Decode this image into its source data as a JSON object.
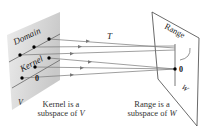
{
  "diagram": {
    "labels": {
      "domain": "Domain",
      "kernel": "Kernel",
      "v": "V",
      "range": "Range",
      "w": "W",
      "t": "T",
      "zero_left": "0",
      "zero_right": "0"
    },
    "captions": {
      "kernel_line1": "Kernel is a",
      "kernel_line2_prefix": "subspace of ",
      "kernel_line2_var": "V",
      "range_line1": "Range is a",
      "range_line2_prefix": "subspace of ",
      "range_line2_var": "W"
    },
    "colors": {
      "left_plane": "#d6d6d6",
      "right_plane": "#ffffff",
      "lines": "#6e6e6e",
      "dots": "#000000"
    }
  }
}
